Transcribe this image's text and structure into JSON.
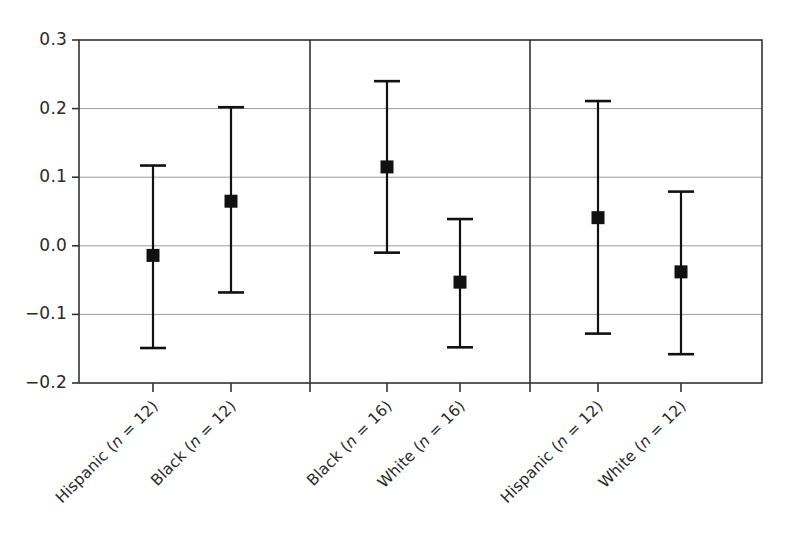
{
  "chart_data": {
    "type": "scatter",
    "title": "",
    "xlabel": "",
    "ylabel": "",
    "ylim": [
      -0.2,
      0.3
    ],
    "yticks": [
      "0.3",
      "0.2",
      "0.1",
      "0.0",
      "-0.1",
      "-0.2"
    ],
    "ytick_values": [
      0.3,
      0.2,
      0.1,
      0.0,
      -0.1,
      -0.2
    ],
    "grid": "horizontal-gridlines-at-yticks",
    "legend": "none",
    "marker": "filled-square",
    "errorbar_style": "capped-vertical",
    "panel_dividers": [
      2,
      4
    ],
    "groups": [
      {
        "name": "group-1",
        "points": [
          {
            "label_prefix": "Hispanic",
            "label_n": "(n = 12)",
            "estimate": -0.014,
            "ci_low": -0.149,
            "ci_high": 0.117
          },
          {
            "label_prefix": "Black",
            "label_n": "(n = 12)",
            "estimate": 0.065,
            "ci_low": -0.068,
            "ci_high": 0.202
          }
        ]
      },
      {
        "name": "group-2",
        "points": [
          {
            "label_prefix": "Black",
            "label_n": "(n = 16)",
            "estimate": 0.115,
            "ci_low": -0.01,
            "ci_high": 0.24
          },
          {
            "label_prefix": "White",
            "label_n": "(n = 16)",
            "estimate": -0.053,
            "ci_low": -0.148,
            "ci_high": 0.039
          }
        ]
      },
      {
        "name": "group-3",
        "points": [
          {
            "label_prefix": "Hispanic",
            "label_n": "(n = 12)",
            "estimate": 0.041,
            "ci_low": -0.128,
            "ci_high": 0.211
          },
          {
            "label_prefix": "White",
            "label_n": "(n = 12)",
            "estimate": -0.038,
            "ci_low": -0.158,
            "ci_high": 0.079
          }
        ]
      }
    ],
    "x_positions": [
      153,
      231,
      387,
      460,
      598,
      681
    ],
    "axis_color": "#333333",
    "grid_color": "#9a9a9a",
    "marker_color": "#111111"
  }
}
